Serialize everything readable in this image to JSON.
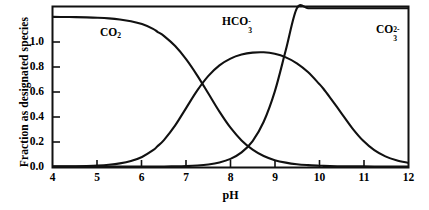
{
  "chart_data": {
    "type": "line",
    "title": "",
    "xlabel": "pH",
    "ylabel": "Fraction as designated species",
    "xlim": [
      4,
      12
    ],
    "ylim": [
      0.0,
      1.29
    ],
    "xticks": [
      "4",
      "5",
      "6",
      "7",
      "8",
      "9",
      "10",
      "11",
      "12"
    ],
    "xtick_values": [
      4,
      5,
      6,
      7,
      8,
      9,
      10,
      11,
      12
    ],
    "yticks": [
      "0.0",
      "0.2",
      "0.4",
      "0.6",
      "0.8",
      "1.0"
    ],
    "ytick_values": [
      0.0,
      0.2,
      0.4,
      0.6,
      0.8,
      1.0
    ],
    "grid": false,
    "legend_position": "inline-annotations",
    "plateau_value": 1.2,
    "pKa1": 6.35,
    "pKa2": 10.1,
    "x": [
      4.0,
      4.25,
      4.5,
      4.75,
      5.0,
      5.25,
      5.5,
      5.75,
      6.0,
      6.25,
      6.35,
      6.5,
      6.75,
      7.0,
      7.25,
      7.5,
      7.75,
      8.0,
      8.25,
      8.5,
      8.75,
      9.0,
      9.25,
      9.5,
      9.75,
      10.0,
      10.1,
      10.25,
      10.5,
      10.75,
      11.0,
      11.25,
      11.5,
      11.75,
      12.0
    ],
    "series": [
      {
        "name": "CO2",
        "label_html": "CO<sub>2</sub>",
        "color": "#111111",
        "values": [
          1.2,
          1.199,
          1.198,
          1.196,
          1.193,
          1.188,
          1.179,
          1.165,
          1.142,
          1.104,
          1.08,
          1.046,
          0.966,
          0.859,
          0.729,
          0.585,
          0.44,
          0.311,
          0.209,
          0.135,
          0.084,
          0.051,
          0.031,
          0.018,
          0.011,
          0.0065,
          0.0052,
          0.0037,
          0.0021,
          0.0012,
          0.0007,
          0.0004,
          0.0002,
          0.0001,
          0.0001
        ]
      },
      {
        "name": "HCO3-",
        "label_html": "HCO<sub>3</sub><sup>-</sup>",
        "color": "#111111",
        "values": [
          0.0008,
          0.0014,
          0.0025,
          0.0045,
          0.008,
          0.0142,
          0.0251,
          0.0441,
          0.0767,
          0.1306,
          0.162,
          0.2137,
          0.3299,
          0.4706,
          0.6103,
          0.7267,
          0.8109,
          0.8654,
          0.8974,
          0.9133,
          0.9158,
          0.9038,
          0.8754,
          0.8278,
          0.7577,
          0.6642,
          0.6235,
          0.5529,
          0.4307,
          0.3084,
          0.2061,
          0.1312,
          0.0813,
          0.0497,
          0.0302
        ]
      },
      {
        "name": "CO3 2-",
        "label_html": "CO<sub>3</sub><sup>2-</sup>",
        "color": "#111111",
        "values": [
          0.0,
          0.0,
          0.0,
          0.0,
          0.0,
          0.0,
          0.0,
          0.0,
          0.0001,
          0.0002,
          0.0003,
          0.0005,
          0.0013,
          0.0033,
          0.0077,
          0.0163,
          0.0323,
          0.0613,
          0.1128,
          0.2039,
          0.3586,
          0.6,
          0.9337,
          1.3177,
          1.6716,
          1.9218,
          1.978,
          2.0712,
          2.1612,
          2.1907,
          2.1991,
          2.1998,
          2.2,
          2.2,
          2.2
        ]
      }
    ],
    "annotations": [
      {
        "name": "CO2",
        "x": 5.5,
        "y": 1.04
      },
      {
        "name": "HCO3-",
        "x": 8.1,
        "y": 1.19
      },
      {
        "name": "CO3 2-",
        "x": 11.45,
        "y": 1.09
      }
    ]
  },
  "labels": {
    "x_axis_title": "pH",
    "y_axis_title": "Fraction as designated species",
    "y_ticks": [
      "1.0",
      "0.8",
      "0.6",
      "0.4",
      "0.2",
      "0.0"
    ],
    "x_ticks": [
      "4",
      "5",
      "6",
      "7",
      "8",
      "9",
      "10",
      "11",
      "12"
    ],
    "species": {
      "co2_base": "CO",
      "co2_sub": "2",
      "hco3_base": "HCO",
      "hco3_sub": "3",
      "hco3_sup": "-",
      "co3_base": "CO",
      "co3_sub": "3",
      "co3_sup": "2-"
    }
  },
  "style": {
    "frame_color": "#111111",
    "curve_color": "#111111",
    "background": "#ffffff"
  }
}
